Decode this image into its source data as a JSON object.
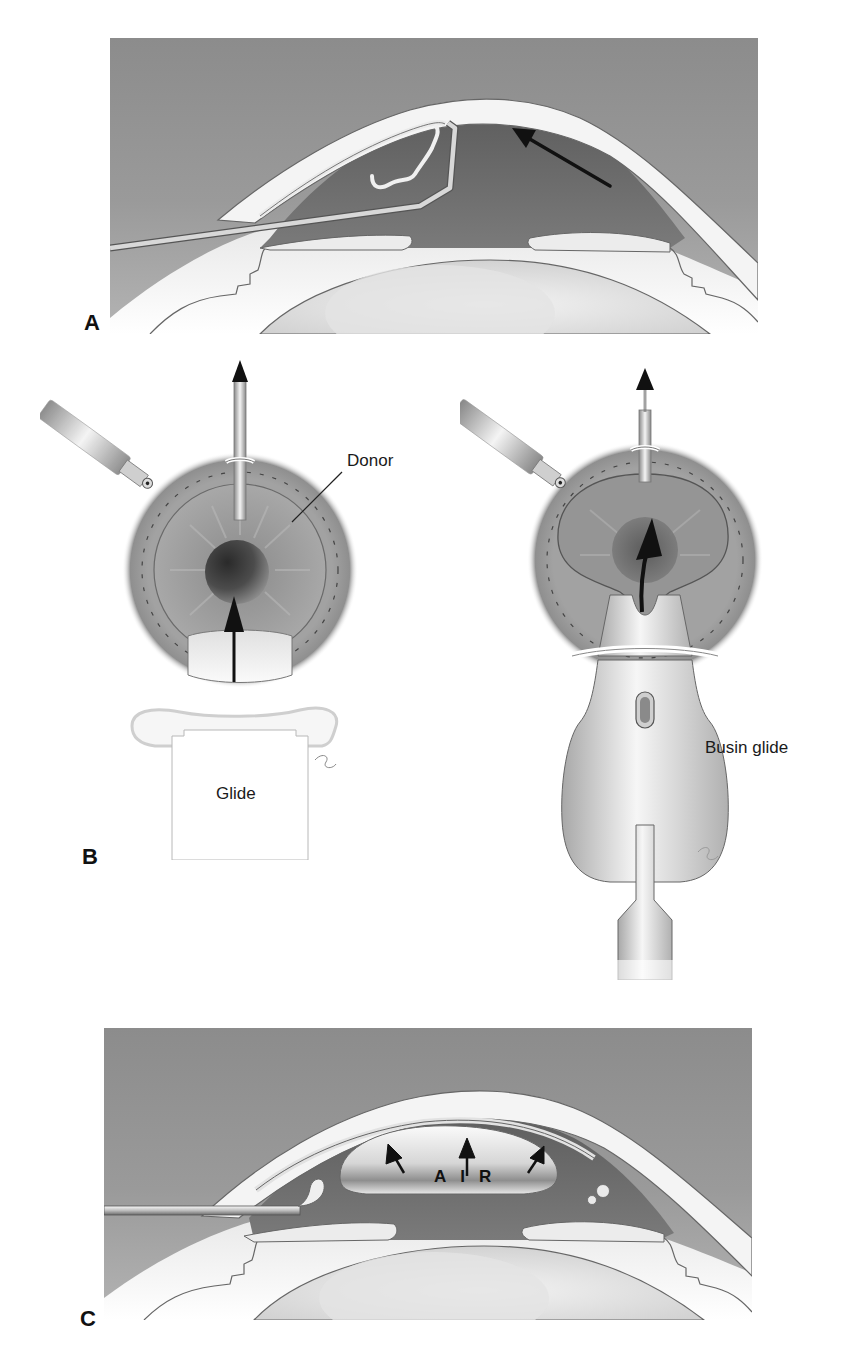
{
  "figure": {
    "panels": [
      {
        "id": "A",
        "letter": "A",
        "description": "Cross-section of anterior chamber with folded donor tissue being inserted, arrow indicating direction"
      },
      {
        "id": "B",
        "letter": "B",
        "labels": {
          "donor": "Donor",
          "glide": "Glide",
          "busin_glide": "Busin glide"
        },
        "description": "En-face view of donor graft pulled into eye via glide (left) and Busin glide (right)"
      },
      {
        "id": "C",
        "letter": "C",
        "labels": {
          "air": "AIR"
        },
        "description": "Cross-section with air bubble pressing graft against cornea, three upward arrows"
      }
    ],
    "colors": {
      "background_gray": "#8a8a8a",
      "cornea_white": "#f2f2f2",
      "chamber_dark": "#6f6f6f",
      "iris_gray": "#9a9a9a",
      "pupil_dark": "#3a3a3a",
      "outline": "#555555",
      "arrow": "#111111"
    }
  }
}
